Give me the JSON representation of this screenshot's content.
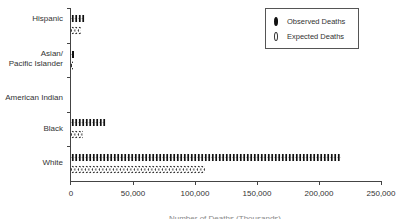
{
  "chart_data": {
    "type": "bar",
    "orientation": "horizontal",
    "style": "pictograph",
    "title": "",
    "xlabel": "",
    "xlabel_note": "axis title cropped at bottom edge, illegible",
    "ylabel": "",
    "categories": [
      "Hispanic",
      "Asian/ Pacific Islander",
      "American Indian",
      "Black",
      "White"
    ],
    "series": [
      {
        "name": "Observed Deaths",
        "marker": "filled-figure",
        "values": [
          11000,
          3000,
          0,
          28000,
          218000
        ]
      },
      {
        "name": "Expected Deaths",
        "marker": "outline-figure",
        "values": [
          8000,
          2000,
          0,
          10000,
          108000
        ]
      }
    ],
    "xlim": [
      0,
      250000
    ],
    "xticks": [
      0,
      50000,
      100000,
      150000,
      200000,
      250000
    ],
    "xtick_labels": [
      "0",
      "50,000",
      "100,000",
      "150,000",
      "200,000",
      "250,000"
    ],
    "grid": false,
    "legend_position": "top-right"
  },
  "legend": {
    "items": [
      {
        "label": "Observed Deaths",
        "icon": "filled-person-icon"
      },
      {
        "label": "Expected Deaths",
        "icon": "outline-person-icon"
      }
    ]
  },
  "y_labels": {
    "hispanic": "Hispanic",
    "asian_line1": "Asian/",
    "asian_line2": "Pacific Islander",
    "american_indian": "American Indian",
    "black": "Black",
    "white": "White"
  },
  "x_labels": [
    "0",
    "50,000",
    "100,000",
    "150,000",
    "200,000",
    "250,000"
  ],
  "axis_title_fragment": "Number of Deaths (Thousands)"
}
